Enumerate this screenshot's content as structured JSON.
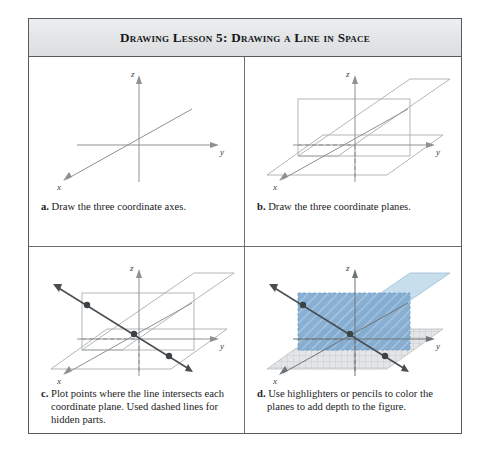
{
  "figure": {
    "header_title": "Drawing Lesson 5: Drawing a Line in Space",
    "panels": [
      {
        "key": "a",
        "marker": "a.",
        "caption": "Draw the three coordinate axes.",
        "axis_labels": {
          "x": "x",
          "y": "y",
          "z": "z"
        },
        "contents": "three coordinate axes only"
      },
      {
        "key": "b",
        "marker": "b.",
        "caption": "Draw the three coordinate planes.",
        "axis_labels": {
          "x": "x",
          "y": "y",
          "z": "z"
        },
        "contents": "three coordinate planes drawn as parallelograms, hidden z-axis segment dashed"
      },
      {
        "key": "c",
        "marker": "c.",
        "caption": "Plot points where the line intersects each coordinate plane. Used dashed lines for hidden parts.",
        "axis_labels": {
          "x": "x",
          "y": "y",
          "z": "z"
        },
        "contents": "line through space with three plotted intersection points",
        "point_count": 3
      },
      {
        "key": "d",
        "marker": "d.",
        "caption": "Use highlighters or pencils to color the planes to add depth to the figure.",
        "axis_labels": {
          "x": "x",
          "y": "y",
          "z": "z"
        },
        "contents": "planes shaded with blue and gray highlighter tones",
        "point_count": 3
      }
    ]
  },
  "colors": {
    "frame_border": "#555b5e",
    "header_background": "#e4e6e7",
    "header_text": "#16181a",
    "axis_line": "#8d9194",
    "plane_outline": "#a9adb0",
    "solid_line": "#4a4e52",
    "point_fill": "#3d4246",
    "plane_xz_blue": "#7fa9cf",
    "plane_yz_blue": "#bdd8ea",
    "plane_xy_gray": "#d9dbdc",
    "caption_text": "#1a1c1e"
  }
}
